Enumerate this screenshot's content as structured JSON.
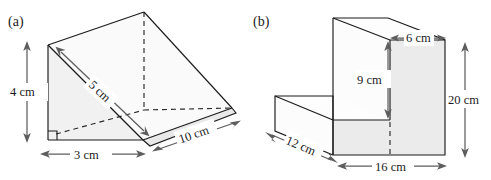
{
  "figure_a": {
    "label": "(a)",
    "shape": "triangular-prism",
    "dimensions": [
      {
        "name": "height",
        "value": "4 cm",
        "orientation": "vertical-left"
      },
      {
        "name": "slant",
        "value": "5 cm",
        "orientation": "diagonal-face"
      },
      {
        "name": "base",
        "value": "3 cm",
        "orientation": "horizontal-bottom"
      },
      {
        "name": "length",
        "value": "10 cm",
        "orientation": "diagonal-depth"
      }
    ],
    "right_angle_marked": true
  },
  "figure_b": {
    "label": "(b)",
    "shape": "step-prism",
    "dimensions": [
      {
        "name": "top-depth",
        "value": "6 cm",
        "orientation": "horizontal-top"
      },
      {
        "name": "step-height",
        "value": "9 cm",
        "orientation": "vertical-inner"
      },
      {
        "name": "total-height",
        "value": "20 cm",
        "orientation": "vertical-right"
      },
      {
        "name": "depth",
        "value": "12 cm",
        "orientation": "diagonal-depth"
      },
      {
        "name": "width",
        "value": "16 cm",
        "orientation": "horizontal-bottom"
      }
    ]
  },
  "colors": {
    "edge": "#1b1b1b",
    "dimension": "#5d5d5d",
    "face_light": "#f2f2f2",
    "face_shade": "#ebebeb",
    "background": "#ffffff"
  }
}
